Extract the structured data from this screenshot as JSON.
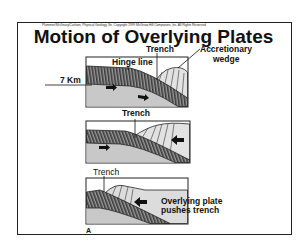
{
  "slide": {
    "copyright": "Plummer/McGeary/Carlson, Physical Geology, 8e. Copyright 1999 McGraw-Hill Companies, Inc. All Rights Reserved",
    "title": "Motion of Overlying Plates",
    "figure_label": "A"
  },
  "panels": [
    {
      "labels": {
        "trench": "Trench",
        "accretionary_line1": "Accretionary",
        "accretionary_line2": "wedge",
        "hinge": "Hinge line",
        "depth": "7 Km"
      }
    },
    {
      "labels": {
        "trench": "Trench"
      }
    },
    {
      "labels": {
        "trench": "Trench",
        "push_line1": "Overlying plate",
        "push_line2": "pushes trench"
      }
    }
  ],
  "colors": {
    "ink": "#111111",
    "stripe_dark": "#3a3a3a",
    "stripe_light": "#9a9a9a",
    "mantle": "#c8c8c8",
    "wedge": "#e2e2e2",
    "overlying": "#dcdcdc"
  }
}
